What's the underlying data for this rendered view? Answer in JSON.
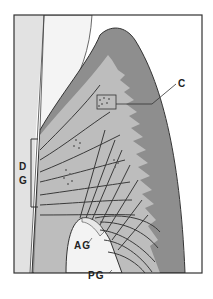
{
  "figure": {
    "labels": {
      "c": "C",
      "dg_d": "D",
      "dg_g": "G",
      "ag": "AG",
      "pg": "PG"
    },
    "colors": {
      "frame": "#333333",
      "tooth": "#ececec",
      "enamel_light": "#f7f7f7",
      "gingiva_dark": "#8e8e8e",
      "connective": "#b9b9b9",
      "bone": "#f3f3f3",
      "fibers": "#3a3a3a"
    }
  }
}
